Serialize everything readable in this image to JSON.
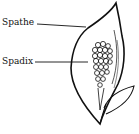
{
  "diagram": {
    "labels": [
      {
        "id": "spathe",
        "text": "Spathe"
      },
      {
        "id": "spadix",
        "text": "Spadix"
      }
    ],
    "colors": {
      "ink": "#111111",
      "background": "#ffffff"
    }
  }
}
